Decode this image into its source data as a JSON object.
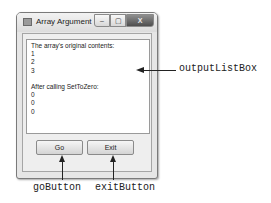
{
  "window": {
    "title": "Array Argument",
    "controls": {
      "minimize": "–",
      "maximize": "▢",
      "close": "X"
    }
  },
  "listbox": {
    "items": [
      "The array's original contents:",
      "1",
      "2",
      "3",
      "",
      "After calling SetToZero:",
      "0",
      "0",
      "0"
    ]
  },
  "buttons": {
    "go": "Go",
    "exit": "Exit"
  },
  "callouts": {
    "listbox": "outputListBox",
    "go": "goButton",
    "exit": "exitButton"
  }
}
